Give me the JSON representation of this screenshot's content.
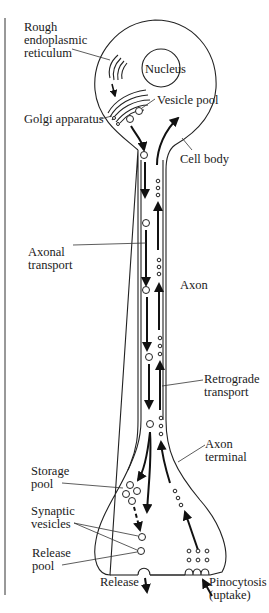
{
  "figure": {
    "type": "neuron-transport-diagram",
    "labels": {
      "rough_er_1": "Rough",
      "rough_er_2": "endoplasmic",
      "rough_er_3": "reticulum",
      "nucleus": "Nucleus",
      "vesicle_pool": "Vesicle pool",
      "golgi": "Golgi apparatus",
      "cell_body": "Cell body",
      "axonal_transport_1": "Axonal",
      "axonal_transport_2": "transport",
      "axon": "Axon",
      "retrograde_1": "Retrograde",
      "retrograde_2": "transport",
      "axon_terminal_1": "Axon",
      "axon_terminal_2": "terminal",
      "storage_pool_1": "Storage",
      "storage_pool_2": "pool",
      "synaptic_vesicles_1": "Synaptic",
      "synaptic_vesicles_2": "vesicles",
      "release_pool_1": "Release",
      "release_pool_2": "pool",
      "release": "Release",
      "pinocytosis_1": "Pinocytosis",
      "pinocytosis_2": "(uptake)"
    },
    "colors": {
      "line": "#222222",
      "background": "#ffffff"
    }
  }
}
